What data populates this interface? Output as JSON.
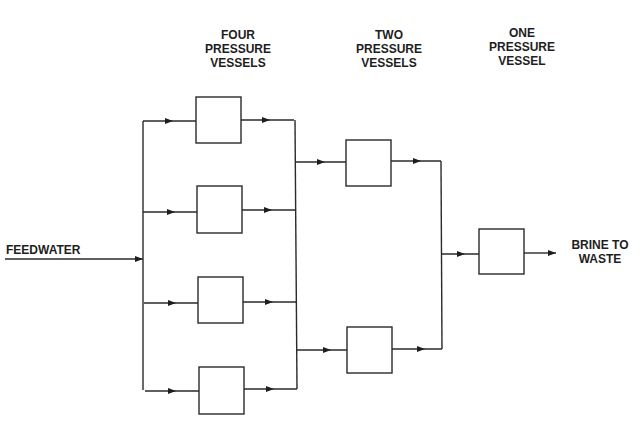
{
  "diagram": {
    "type": "process-flow",
    "stage_labels": [
      {
        "lines": [
          "FOUR",
          "PRESSURE",
          "VESSELS"
        ]
      },
      {
        "lines": [
          "TWO",
          "PRESSURE",
          "VESSELS"
        ]
      },
      {
        "lines": [
          "ONE",
          "PRESSURE",
          "VESSEL"
        ]
      }
    ],
    "inlet_label": "FEEDWATER",
    "outlet_label_lines": [
      "BRINE TO",
      "WASTE"
    ],
    "stages": [
      {
        "name": "stage-1",
        "vessel_count": 4
      },
      {
        "name": "stage-2",
        "vessel_count": 2
      },
      {
        "name": "stage-3",
        "vessel_count": 1
      }
    ],
    "line_color": "#2a2a2a",
    "text_color": "#1e1e1e"
  }
}
